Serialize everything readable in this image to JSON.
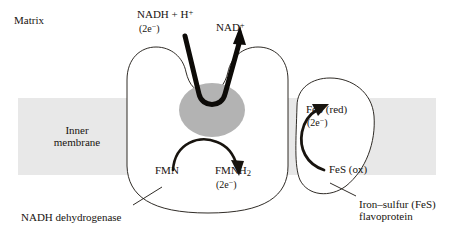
{
  "figure": {
    "title_region": "mitochondrial-inner-membrane-complex-i",
    "background_color": "#ffffff",
    "ink_color": "#18140f",
    "membrane_color": "#e8e8e8",
    "blob_color": "#b3b3b3"
  },
  "labels": {
    "matrix": "Matrix",
    "inner_membrane_line1": "Inner",
    "inner_membrane_line2": "membrane",
    "nadh_name": "NADH + H",
    "nadh_charge": "+",
    "nadh_electrons": "(2e",
    "nadh_electrons_sup": "−",
    "nadh_electrons_close": ")",
    "nad_name": "NAD",
    "nad_charge": "+",
    "fmn": "FMN",
    "fmnh2_name": "FMNH",
    "fmnh2_sub": "2",
    "fmnh2_electrons": "(2e",
    "fmnh2_electrons_sup": "−",
    "fmnh2_electrons_close": ")",
    "fes_red": "FeS (red)",
    "fes_red_electrons": "(2e",
    "fes_red_electrons_sup": "−",
    "fes_red_electrons_close": ")",
    "fes_ox": "FeS (ox)",
    "nadh_dehydrogenase": "NADH dehydrogenase",
    "iron_sulfur_line1": "Iron–sulfur (FeS)",
    "iron_sulfur_line2": "flavoprotein"
  },
  "diagram_data": {
    "type": "diagram",
    "subject": "Complex I (NADH dehydrogenase) electron transfer in the mitochondrial inner membrane",
    "compartments": [
      {
        "name": "Matrix",
        "position": "above membrane"
      },
      {
        "name": "Inner membrane",
        "position": "horizontal gray band"
      }
    ],
    "proteins": [
      {
        "name": "NADH dehydrogenase",
        "shape": "U-shaped cup with notched top",
        "cofactor": "FMN / FMNH2"
      },
      {
        "name": "Iron–sulfur (FeS) flavoprotein",
        "shape": "rounded lobe at right",
        "cofactor": "FeS centers"
      }
    ],
    "electron_carriers": [
      {
        "label": "NADH + H+",
        "electrons": "2e−",
        "role": "electron donor"
      },
      {
        "label": "NAD+",
        "electrons": "",
        "role": "oxidized product"
      },
      {
        "label": "FMN",
        "electrons": "",
        "role": "oxidized flavin"
      },
      {
        "label": "FMNH2",
        "electrons": "2e−",
        "role": "reduced flavin"
      },
      {
        "label": "FeS (ox)",
        "electrons": "",
        "role": "oxidized iron-sulfur center"
      },
      {
        "label": "FeS (red)",
        "electrons": "2e−",
        "role": "reduced iron-sulfur center"
      }
    ],
    "arrows": [
      {
        "from": "NADH + H+ (2e−)",
        "to": "NAD+",
        "style": "thick V-shaped, down into protein cleft then up",
        "weight": "heavy"
      },
      {
        "from": "FMN",
        "to": "FMNH2 (2e−)",
        "style": "curved arc, clockwise",
        "weight": "medium"
      },
      {
        "from": "FeS (ox)",
        "to": "FeS (red) (2e−)",
        "style": "curved arc, counter-clockwise",
        "weight": "medium"
      }
    ],
    "leader_lines": [
      {
        "label": "NADH dehydrogenase",
        "points_to": "U-shaped protein body"
      },
      {
        "label": "Iron–sulfur (FeS) flavoprotein",
        "points_to": "right lobe"
      }
    ]
  }
}
